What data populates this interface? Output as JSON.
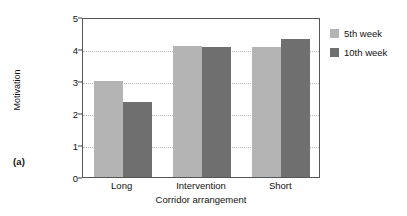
{
  "panel": {
    "label": "(a)"
  },
  "legend": {
    "position": "right",
    "entries": [
      {
        "label": "5th week",
        "color": "#b4b4b4",
        "swatch_name": "legend-swatch-5th-week"
      },
      {
        "label": "10th week",
        "color": "#6f6f6f",
        "swatch_name": "legend-swatch-10th-week"
      }
    ]
  },
  "axes": {
    "y": {
      "label": "Motivation",
      "ticks": [
        "0",
        "1",
        "2",
        "3",
        "4",
        "5"
      ],
      "min": 0,
      "max": 5
    },
    "x": {
      "label": "Corridor arrangement",
      "ticks": [
        "Long",
        "Intervention",
        "Short"
      ]
    }
  },
  "chart_data": {
    "type": "bar",
    "title": "",
    "xlabel": "Corridor arrangement",
    "ylabel": "Motivation",
    "categories": [
      "Long",
      "Intervention",
      "Short"
    ],
    "series": [
      {
        "name": "5th week",
        "color": "#b4b4b4",
        "values": [
          3.0,
          4.1,
          4.05
        ]
      },
      {
        "name": "10th week",
        "color": "#6f6f6f",
        "values": [
          2.35,
          4.05,
          4.3
        ]
      }
    ],
    "ylim": [
      0,
      5
    ],
    "yticks": [
      0,
      1,
      2,
      3,
      4,
      5
    ],
    "grid": "horizontal-dotted",
    "legend_position": "right"
  }
}
